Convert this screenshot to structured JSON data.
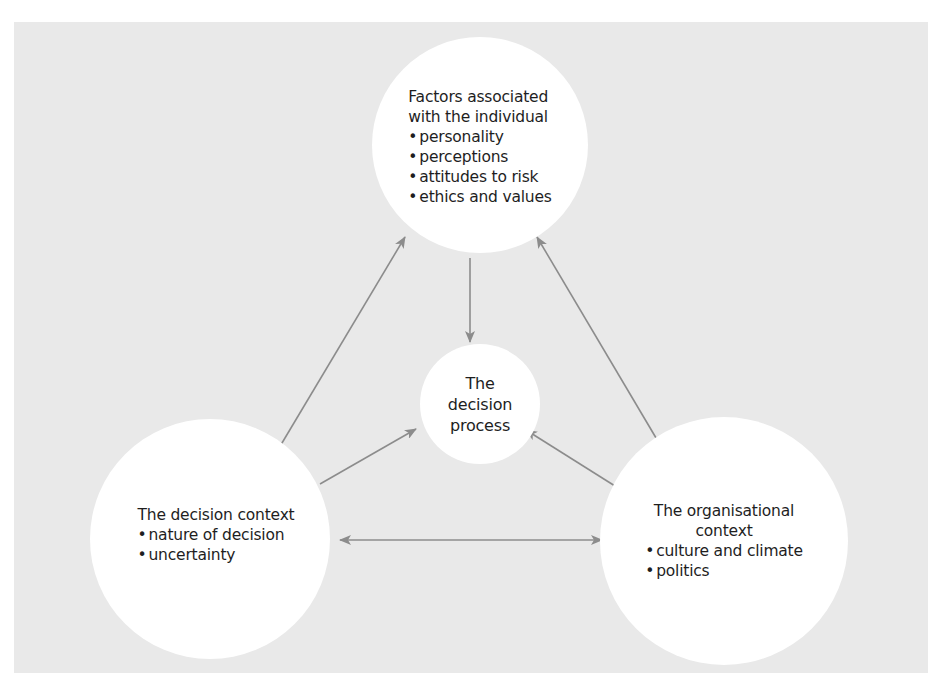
{
  "diagram": {
    "colors": {
      "background": "#ffffff",
      "panel": "#e9e9e9",
      "node_fill": "#ffffff",
      "arrow": "#8c8c8c",
      "text": "#1e1e1e"
    },
    "nodes": {
      "individual": {
        "title_line1": "Factors associated",
        "title_line2": "with the individual",
        "bullets": [
          "personality",
          "perceptions",
          "attitudes to risk",
          "ethics and values"
        ]
      },
      "process": {
        "line1": "The",
        "line2": "decision",
        "line3": "process"
      },
      "context": {
        "title": "The decision context",
        "bullets": [
          "nature of decision",
          "uncertainty"
        ]
      },
      "organisational": {
        "title_line1": "The organisational",
        "title_line2": "context",
        "bullets": [
          "culture and climate",
          "politics"
        ]
      }
    },
    "edges": [
      {
        "from": "individual",
        "to": "process",
        "direction": "one-way"
      },
      {
        "from": "context",
        "to": "process",
        "direction": "one-way"
      },
      {
        "from": "organisational",
        "to": "process",
        "direction": "one-way"
      },
      {
        "from": "context",
        "to": "individual",
        "direction": "one-way"
      },
      {
        "from": "organisational",
        "to": "individual",
        "direction": "one-way"
      },
      {
        "from": "context",
        "to": "organisational",
        "direction": "two-way"
      }
    ]
  }
}
